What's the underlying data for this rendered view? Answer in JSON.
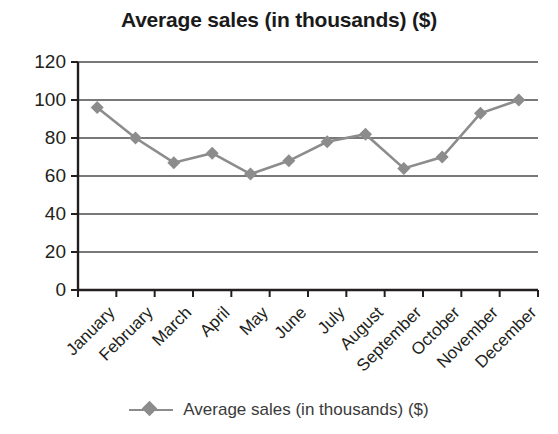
{
  "chart_data": {
    "type": "line",
    "title": "Average sales (in thousands) ($)",
    "xlabel": "",
    "ylabel": "",
    "ylim": [
      0,
      120
    ],
    "ytick_step": 20,
    "yticks": [
      120,
      100,
      80,
      60,
      40,
      20,
      0
    ],
    "grid": true,
    "grid_axis": "y",
    "legend_position": "bottom",
    "categories": [
      "January",
      "February",
      "March",
      "April",
      "May",
      "June",
      "July",
      "August",
      "September",
      "October",
      "November",
      "December"
    ],
    "series": [
      {
        "name": "Average sales (in thousands) ($)",
        "color": "#8c8c8c",
        "marker": "diamond",
        "values": [
          96,
          80,
          67,
          72,
          61,
          68,
          78,
          82,
          64,
          70,
          93,
          100
        ]
      }
    ]
  },
  "legend": {
    "entries": [
      {
        "label": "Average sales (in thousands) ($)"
      }
    ]
  },
  "colors": {
    "series": "#8c8c8c",
    "axis": "#231f20",
    "grid": "#4d4d4d",
    "text": "#231f20",
    "background": "#ffffff"
  }
}
